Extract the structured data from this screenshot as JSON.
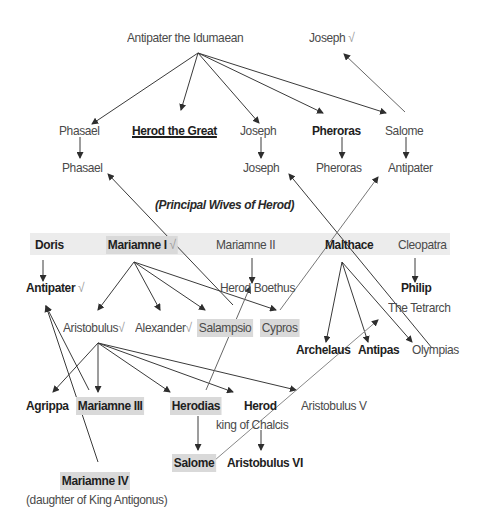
{
  "diagram": {
    "title": "(Principal Wives of Herod)",
    "generation_1": {
      "root": "Antipater the Idumaean",
      "joseph_top": {
        "name": "Joseph",
        "mark": "√"
      }
    },
    "generation_2": {
      "phasael": "Phasael",
      "herod": "Herod the Great",
      "joseph": "Joseph",
      "pheroras": "Pheroras",
      "salome": "Salome"
    },
    "generation_3": {
      "phasael": "Phasael",
      "joseph": "Joseph",
      "pheroras": "Pheroras",
      "antipater": "Antipater"
    },
    "wives": {
      "doris": "Doris",
      "mariamne1": {
        "name": "Mariamne I",
        "mark": "√"
      },
      "mariamne2": "Mariamne II",
      "malthace": "Malthace",
      "cleopatra": "Cleopatra"
    },
    "children": {
      "antipater": {
        "name": "Antipater",
        "mark": "√"
      },
      "herod_boethus": "Herod Boethus",
      "philip": "Philip",
      "philip_sub": "The Tetrarch",
      "aristobulus": {
        "name": "Aristobulus",
        "mark": "√"
      },
      "alexander": {
        "name": "Alexander",
        "mark": "√"
      },
      "salampsio": "Salampsio",
      "cypros": "Cypros",
      "archelaus": "Archelaus",
      "antipas": "Antipas",
      "olympias": "Olympias"
    },
    "grandchildren": {
      "agrippa": "Agrippa",
      "mariamne3": "Mariamne III",
      "herodias": "Herodias",
      "herod_chalcis": "Herod",
      "herod_chalcis_sub": "king of Chalcis",
      "aristobulus5": "Aristobulus V"
    },
    "great_grandchildren": {
      "salome": "Salome",
      "aristobulus6": "Aristobulus VI"
    },
    "other": {
      "mariamne4": "Mariamne IV",
      "mariamne4_sub": "(daughter of King Antigonus)"
    },
    "colors": {
      "band": "#ececec",
      "highlight": "#d9d9d9",
      "line": "#3a3a3a",
      "text": "#4a4a4a",
      "bold_text": "#1e1e1e"
    }
  }
}
